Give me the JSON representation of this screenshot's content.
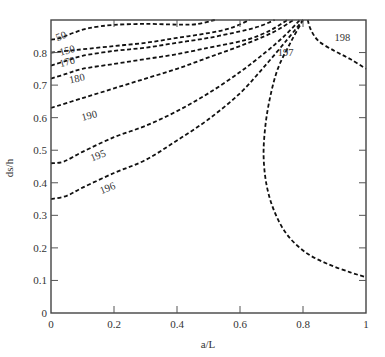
{
  "chart_data": {
    "type": "line",
    "subtype": "contour",
    "title": "",
    "xlabel": "a/L",
    "ylabel": "ds/h",
    "xlim": [
      0,
      1
    ],
    "ylim": [
      0,
      0.9
    ],
    "xticks": [
      0,
      0.2,
      0.4,
      0.6,
      0.8,
      1
    ],
    "xtick_labels": [
      "0",
      "0.2",
      "0.4",
      "0.6",
      "0.8",
      "1"
    ],
    "yticks": [
      0,
      0.1,
      0.2,
      0.3,
      0.4,
      0.5,
      0.6,
      0.7,
      0.8
    ],
    "ytick_labels": [
      "0",
      "0.1",
      "0.2",
      "0.3",
      "0.4",
      "0.5",
      "0.6",
      "0.7",
      "0.8"
    ],
    "grid": false,
    "line_style": "dashed",
    "line_color": "#111111",
    "series": [
      {
        "name": "50",
        "label_pos": [
          0.02,
          0.835
        ],
        "label_rot": 20,
        "points": [
          [
            0,
            0.84
          ],
          [
            0.03,
            0.845
          ],
          [
            0.07,
            0.86
          ],
          [
            0.12,
            0.875
          ],
          [
            0.2,
            0.885
          ],
          [
            0.3,
            0.888
          ],
          [
            0.4,
            0.886
          ],
          [
            0.46,
            0.887
          ],
          [
            0.52,
            0.9
          ]
        ]
      },
      {
        "name": "150",
        "label_pos": [
          0.03,
          0.79
        ],
        "label_rot": 15,
        "points": [
          [
            0,
            0.8
          ],
          [
            0.05,
            0.805
          ],
          [
            0.1,
            0.81
          ],
          [
            0.2,
            0.82
          ],
          [
            0.3,
            0.83
          ],
          [
            0.4,
            0.845
          ],
          [
            0.5,
            0.86
          ],
          [
            0.57,
            0.875
          ],
          [
            0.63,
            0.9
          ]
        ]
      },
      {
        "name": "170",
        "label_pos": [
          0.03,
          0.755
        ],
        "label_rot": 15,
        "points": [
          [
            0,
            0.76
          ],
          [
            0.05,
            0.775
          ],
          [
            0.1,
            0.79
          ],
          [
            0.2,
            0.805
          ],
          [
            0.3,
            0.815
          ],
          [
            0.4,
            0.83
          ],
          [
            0.5,
            0.845
          ],
          [
            0.6,
            0.865
          ],
          [
            0.66,
            0.88
          ],
          [
            0.71,
            0.9
          ]
        ]
      },
      {
        "name": "180",
        "label_pos": [
          0.06,
          0.705
        ],
        "label_rot": 12,
        "points": [
          [
            0,
            0.72
          ],
          [
            0.05,
            0.735
          ],
          [
            0.1,
            0.75
          ],
          [
            0.2,
            0.765
          ],
          [
            0.3,
            0.78
          ],
          [
            0.4,
            0.795
          ],
          [
            0.5,
            0.815
          ],
          [
            0.58,
            0.83
          ],
          [
            0.64,
            0.845
          ],
          [
            0.7,
            0.87
          ],
          [
            0.75,
            0.9
          ]
        ]
      },
      {
        "name": "190",
        "label_pos": [
          0.1,
          0.59
        ],
        "label_rot": 15,
        "points": [
          [
            0,
            0.63
          ],
          [
            0.1,
            0.66
          ],
          [
            0.2,
            0.69
          ],
          [
            0.3,
            0.72
          ],
          [
            0.4,
            0.75
          ],
          [
            0.5,
            0.785
          ],
          [
            0.6,
            0.82
          ],
          [
            0.7,
            0.86
          ],
          [
            0.77,
            0.9
          ]
        ]
      },
      {
        "name": "195",
        "label_pos": [
          0.13,
          0.465
        ],
        "label_rot": 22,
        "points": [
          [
            0,
            0.46
          ],
          [
            0.04,
            0.465
          ],
          [
            0.1,
            0.495
          ],
          [
            0.2,
            0.54
          ],
          [
            0.3,
            0.575
          ],
          [
            0.4,
            0.62
          ],
          [
            0.5,
            0.675
          ],
          [
            0.6,
            0.74
          ],
          [
            0.68,
            0.8
          ],
          [
            0.74,
            0.85
          ],
          [
            0.79,
            0.9
          ]
        ]
      },
      {
        "name": "196",
        "label_pos": [
          0.16,
          0.365
        ],
        "label_rot": 22,
        "points": [
          [
            0,
            0.35
          ],
          [
            0.05,
            0.36
          ],
          [
            0.1,
            0.385
          ],
          [
            0.2,
            0.43
          ],
          [
            0.3,
            0.47
          ],
          [
            0.4,
            0.53
          ],
          [
            0.5,
            0.595
          ],
          [
            0.6,
            0.675
          ],
          [
            0.68,
            0.76
          ],
          [
            0.75,
            0.84
          ],
          [
            0.8,
            0.9
          ]
        ]
      },
      {
        "name": "197",
        "label_pos": [
          0.72,
          0.79
        ],
        "label_rot": 0,
        "points": [
          [
            0.8,
            0.9
          ],
          [
            0.76,
            0.83
          ],
          [
            0.72,
            0.75
          ],
          [
            0.695,
            0.66
          ],
          [
            0.68,
            0.57
          ],
          [
            0.675,
            0.48
          ],
          [
            0.685,
            0.39
          ],
          [
            0.71,
            0.31
          ],
          [
            0.75,
            0.24
          ],
          [
            0.81,
            0.185
          ],
          [
            0.88,
            0.15
          ],
          [
            0.95,
            0.125
          ],
          [
            1,
            0.11
          ]
        ]
      },
      {
        "name": "198",
        "label_pos": [
          0.9,
          0.835
        ],
        "label_rot": 0,
        "points": [
          [
            0.815,
            0.9
          ],
          [
            0.825,
            0.87
          ],
          [
            0.85,
            0.835
          ],
          [
            0.9,
            0.805
          ],
          [
            0.95,
            0.78
          ],
          [
            1,
            0.75
          ]
        ]
      }
    ]
  }
}
